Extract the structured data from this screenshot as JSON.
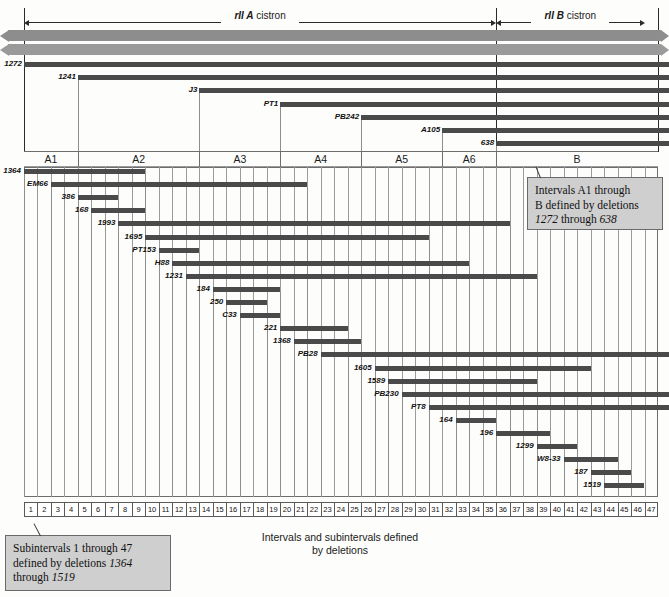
{
  "figure": {
    "caption_line1": "Intervals and subintervals defined",
    "caption_line2": "by deletions",
    "scale_min": 1,
    "scale_max": 47,
    "bar_color": "#4a4a4a",
    "ribbon_color": "#8d8d8d",
    "callout_bg": "#cfcfcf"
  },
  "cistrons": [
    {
      "gene": "rII A",
      "word": " cistron",
      "from": 1,
      "to": 36
    },
    {
      "gene": "rII B",
      "word": " cistron",
      "from": 36,
      "to": 47
    }
  ],
  "intervals": [
    {
      "label": "A1",
      "from": 1,
      "to": 5
    },
    {
      "label": "A2",
      "from": 5,
      "to": 14
    },
    {
      "label": "A3",
      "from": 14,
      "to": 20
    },
    {
      "label": "A4",
      "from": 20,
      "to": 26
    },
    {
      "label": "A5",
      "from": 26,
      "to": 32
    },
    {
      "label": "A6",
      "from": 32,
      "to": 36
    },
    {
      "label": "B",
      "from": 36,
      "to": 48
    }
  ],
  "interval_deletions": [
    {
      "name": "1272",
      "start": 1,
      "end": 48,
      "row": 0
    },
    {
      "name": "1241",
      "start": 5,
      "end": 48,
      "row": 1
    },
    {
      "name": "J3",
      "start": 14,
      "end": 48,
      "row": 2
    },
    {
      "name": "PT1",
      "start": 20,
      "end": 48,
      "row": 3
    },
    {
      "name": "PB242",
      "start": 26,
      "end": 48,
      "row": 4
    },
    {
      "name": "A105",
      "start": 32,
      "end": 48,
      "row": 5
    },
    {
      "name": "638",
      "start": 36,
      "end": 48,
      "row": 6
    }
  ],
  "subinterval_deletions": [
    {
      "name": "1364",
      "start": 1,
      "end": 10,
      "row": 0
    },
    {
      "name": "EM66",
      "start": 3,
      "end": 22,
      "row": 1
    },
    {
      "name": "386",
      "start": 5,
      "end": 8,
      "row": 2
    },
    {
      "name": "168",
      "start": 6,
      "end": 10,
      "row": 3
    },
    {
      "name": "1993",
      "start": 8,
      "end": 37,
      "row": 4
    },
    {
      "name": "1695",
      "start": 10,
      "end": 31,
      "row": 5
    },
    {
      "name": "PT153",
      "start": 11,
      "end": 14,
      "row": 6
    },
    {
      "name": "H88",
      "start": 12,
      "end": 34,
      "row": 7
    },
    {
      "name": "1231",
      "start": 13,
      "end": 39,
      "row": 8
    },
    {
      "name": "184",
      "start": 15,
      "end": 20,
      "row": 9
    },
    {
      "name": "250",
      "start": 16,
      "end": 19,
      "row": 10
    },
    {
      "name": "C33",
      "start": 17,
      "end": 20,
      "row": 11
    },
    {
      "name": "221",
      "start": 20,
      "end": 25,
      "row": 12
    },
    {
      "name": "1368",
      "start": 21,
      "end": 26,
      "row": 13
    },
    {
      "name": "PB28",
      "start": 23,
      "end": 48,
      "row": 14
    },
    {
      "name": "1605",
      "start": 27,
      "end": 43,
      "row": 15
    },
    {
      "name": "1589",
      "start": 28,
      "end": 39,
      "row": 16
    },
    {
      "name": "PB230",
      "start": 29,
      "end": 48,
      "row": 17
    },
    {
      "name": "PT8",
      "start": 31,
      "end": 48,
      "row": 18
    },
    {
      "name": "164",
      "start": 33,
      "end": 36,
      "row": 19
    },
    {
      "name": "196",
      "start": 36,
      "end": 40,
      "row": 20
    },
    {
      "name": "1299",
      "start": 39,
      "end": 42,
      "row": 21
    },
    {
      "name": "W8-33",
      "start": 41,
      "end": 45,
      "row": 22
    },
    {
      "name": "187",
      "start": 43,
      "end": 46,
      "row": 23
    },
    {
      "name": "1519",
      "start": 44,
      "end": 47,
      "row": 24
    }
  ],
  "callouts": [
    {
      "id": "intervals-callout",
      "line1": "Intervals A1 through",
      "line2": "B defined by deletions",
      "line3_pre": "",
      "line3_a": "1272",
      "line3_mid": " through ",
      "line3_b": "638"
    },
    {
      "id": "subintervals-callout",
      "line1": "Subintervals 1 through 47",
      "line2_pre": "defined by deletions ",
      "line2_a": "1364",
      "line3_pre": "through ",
      "line3_a": "1519"
    }
  ]
}
